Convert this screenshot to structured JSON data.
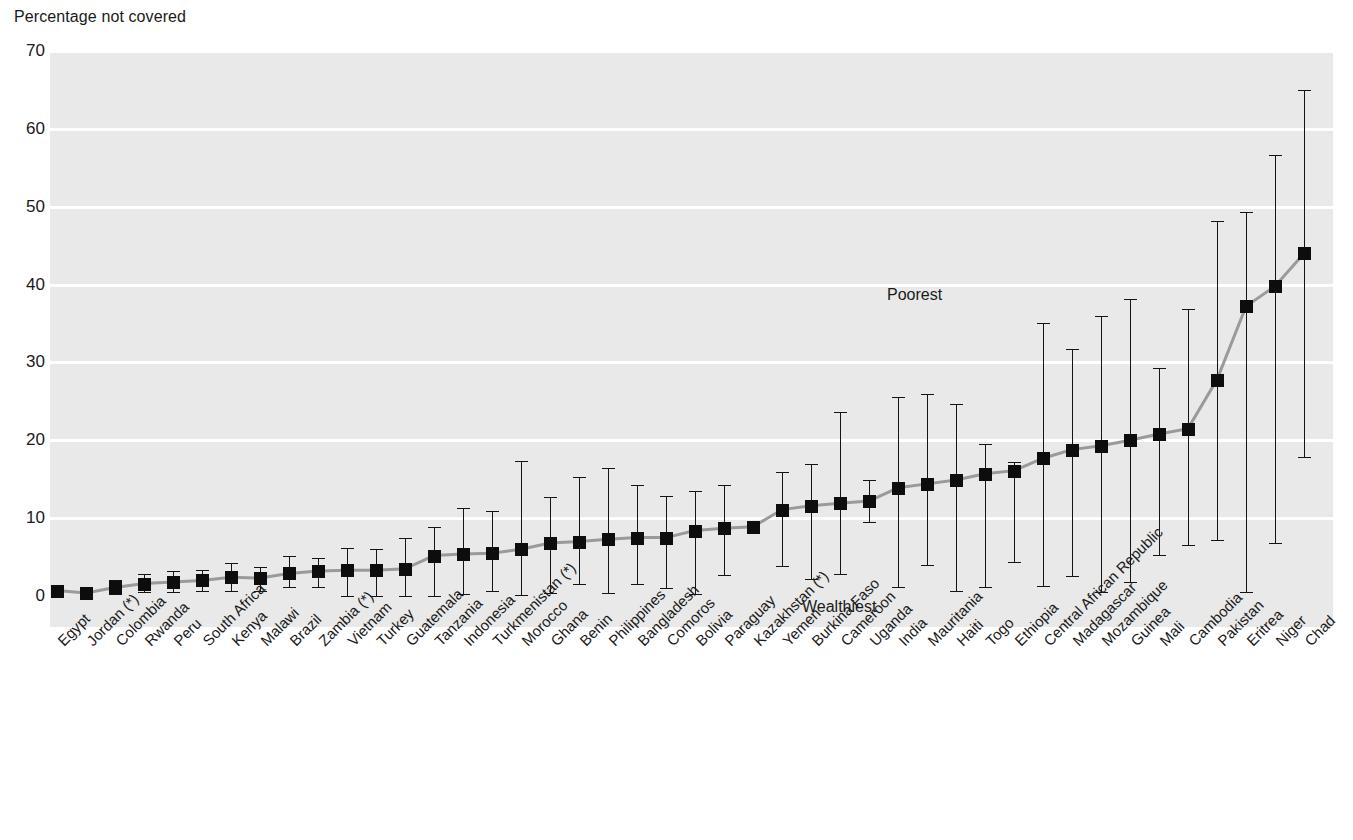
{
  "chart_data": {
    "type": "scatter",
    "title": "Percentage not covered",
    "ylabel": "Percentage not covered",
    "xlabel": "",
    "ylim": [
      0,
      70
    ],
    "yticks": [
      0,
      10,
      20,
      30,
      40,
      50,
      60,
      70
    ],
    "grid": true,
    "legend_position": "none",
    "annotations": [
      {
        "text": "Poorest",
        "x_index": 30,
        "value": 38.5
      },
      {
        "text": "Wealthiest",
        "x_index": 27,
        "value": -1.5
      }
    ],
    "note": "Squares are national averages; vertical bars span wealthiest to poorest quintile",
    "categories": [
      "Egypt",
      "Jordan (*)",
      "Colombia",
      "Rwanda",
      "Peru",
      "South Africa",
      "Kenya",
      "Malawi",
      "Brazil",
      "Zambia (*)",
      "Vietnam",
      "Turkey",
      "Guatemala",
      "Tanzania",
      "Indonesia",
      "Turkmenistan (*)",
      "Morocco",
      "Ghana",
      "Benin",
      "Philippines",
      "Bangladesh",
      "Comoros",
      "Bolivia",
      "Paraguay",
      "Kazakhstan (*)",
      "Yemen",
      "Burkina Faso",
      "Cameroon",
      "Uganda",
      "India",
      "Mauritania",
      "Haiti",
      "Togo",
      "Ethiopia",
      "Central African Republic",
      "Madagascar",
      "Mozambique",
      "Guinea",
      "Mali",
      "Cambodia",
      "Pakistan",
      "Eritrea",
      "Niger",
      "Chad"
    ],
    "values": [
      0.7,
      0.4,
      1.1,
      1.6,
      1.8,
      2.0,
      2.4,
      2.3,
      2.9,
      3.2,
      3.3,
      3.3,
      3.5,
      5.2,
      5.4,
      5.5,
      6.0,
      6.8,
      7.0,
      7.3,
      7.5,
      7.5,
      8.4,
      8.7,
      8.9,
      11.1,
      11.6,
      11.9,
      12.2,
      13.9,
      14.4,
      14.9,
      15.7,
      16.1,
      17.7,
      18.8,
      19.3,
      20.0,
      20.8,
      21.5,
      27.8,
      37.2,
      39.8,
      44.0
    ],
    "lower": [
      0.2,
      0.1,
      0.3,
      0.5,
      0.5,
      0.7,
      0.7,
      0.6,
      1.1,
      1.2,
      0.0,
      0.0,
      0.0,
      0.0,
      0.3,
      0.7,
      0.1,
      0.4,
      1.5,
      0.4,
      1.6,
      1.0,
      0.3,
      2.7,
      8.3,
      3.9,
      2.2,
      2.8,
      9.5,
      1.2,
      4.0,
      0.7,
      1.1,
      4.4,
      1.3,
      2.6,
      0.5,
      1.8,
      5.3,
      6.6,
      7.2,
      0.5,
      6.8,
      17.8
    ],
    "upper": [
      1.3,
      0.8,
      2.1,
      2.8,
      3.2,
      3.3,
      4.2,
      3.7,
      5.1,
      4.9,
      6.2,
      6.1,
      7.4,
      8.9,
      11.3,
      10.9,
      17.4,
      12.7,
      15.3,
      16.4,
      14.2,
      12.9,
      13.5,
      14.3,
      9.0,
      15.9,
      17.0,
      23.6,
      14.9,
      25.5,
      26.0,
      24.7,
      19.5,
      17.2,
      35.1,
      31.7,
      36.0,
      38.2,
      29.3,
      36.8,
      48.2,
      49.3,
      56.6,
      65.0
    ]
  },
  "axis": {
    "title": "Percentage not covered",
    "tick_labels": [
      "70",
      "60",
      "50",
      "40",
      "30",
      "20",
      "10",
      "0"
    ]
  },
  "labels": {
    "poorest": "Poorest",
    "wealthiest": "Wealthiest"
  },
  "colors": {
    "plot_background": "#e9e9e9",
    "gridline": "#ffffff",
    "marker": "#0d0d0d",
    "connector": "#9a9a9a",
    "text": "#1a1a1a"
  }
}
